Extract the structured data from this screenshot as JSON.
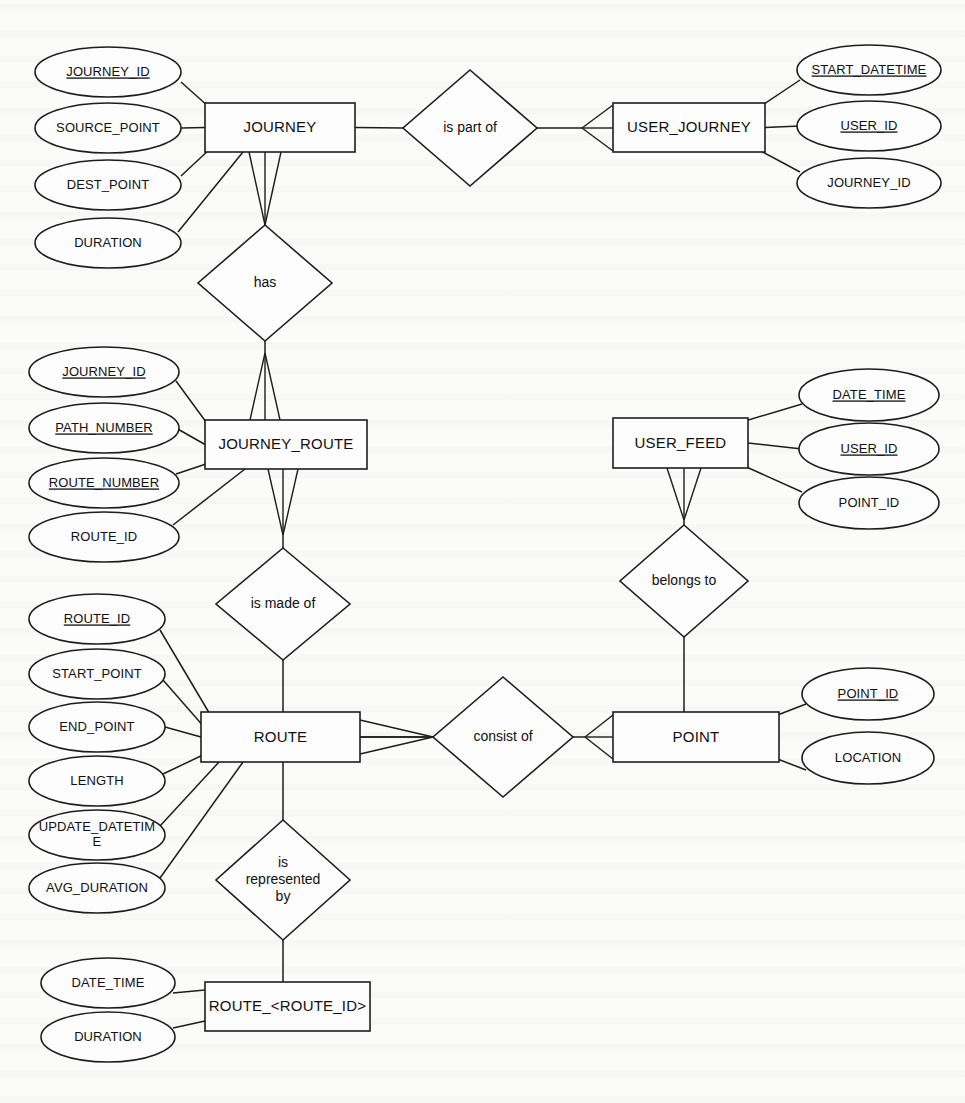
{
  "diagram": {
    "type": "entity-relationship-diagram",
    "notation": "chen-with-crowsfoot",
    "width": 965,
    "height": 1103,
    "background_color": "#fbfbfa",
    "line_color": "#1d1d1d",
    "text_color": "#101010"
  },
  "entities": [
    {
      "id": "journey",
      "label": "JOURNEY",
      "x": 205,
      "y": 103,
      "w": 150,
      "h": 49,
      "attributes": [
        {
          "label": "JOURNEY_ID",
          "pk": true,
          "cx": 108,
          "cy": 72,
          "rx": 73,
          "ry": 25
        },
        {
          "label": "SOURCE_POINT",
          "pk": false,
          "cx": 108,
          "cy": 128,
          "rx": 73,
          "ry": 25
        },
        {
          "label": "DEST_POINT",
          "pk": false,
          "cx": 108,
          "cy": 185,
          "rx": 73,
          "ry": 25
        },
        {
          "label": "DURATION",
          "pk": false,
          "cx": 108,
          "cy": 243,
          "rx": 73,
          "ry": 25
        }
      ]
    },
    {
      "id": "user_journey",
      "label": "USER_JOURNEY",
      "x": 613,
      "y": 103,
      "w": 152,
      "h": 49,
      "attributes": [
        {
          "label": "START_DATETIME",
          "pk": true,
          "cx": 869,
          "cy": 70,
          "rx": 72,
          "ry": 25
        },
        {
          "label": "USER_ID",
          "pk": true,
          "cx": 869,
          "cy": 126,
          "rx": 72,
          "ry": 25
        },
        {
          "label": "JOURNEY_ID",
          "pk": false,
          "cx": 869,
          "cy": 183,
          "rx": 72,
          "ry": 25
        }
      ]
    },
    {
      "id": "journey_route",
      "label": "JOURNEY_ROUTE",
      "x": 205,
      "y": 420,
      "w": 162,
      "h": 49,
      "attributes": [
        {
          "label": "JOURNEY_ID",
          "pk": true,
          "cx": 104,
          "cy": 372,
          "rx": 75,
          "ry": 25
        },
        {
          "label": "PATH_NUMBER",
          "pk": true,
          "cx": 104,
          "cy": 428,
          "rx": 75,
          "ry": 25
        },
        {
          "label": "ROUTE_NUMBER",
          "pk": true,
          "cx": 104,
          "cy": 483,
          "rx": 75,
          "ry": 25
        },
        {
          "label": "ROUTE_ID",
          "pk": false,
          "cx": 104,
          "cy": 537,
          "rx": 75,
          "ry": 25
        }
      ]
    },
    {
      "id": "user_feed",
      "label": "USER_FEED",
      "x": 613,
      "y": 418,
      "w": 135,
      "h": 50,
      "attributes": [
        {
          "label": "DATE_TIME",
          "pk": true,
          "cx": 869,
          "cy": 395,
          "rx": 70,
          "ry": 26
        },
        {
          "label": "USER_ID",
          "pk": true,
          "cx": 869,
          "cy": 449,
          "rx": 70,
          "ry": 26
        },
        {
          "label": "POINT_ID",
          "pk": false,
          "cx": 869,
          "cy": 503,
          "rx": 70,
          "ry": 26
        }
      ]
    },
    {
      "id": "route",
      "label": "ROUTE",
      "x": 201,
      "y": 712,
      "w": 159,
      "h": 50,
      "attributes": [
        {
          "label": "ROUTE_ID",
          "pk": true,
          "cx": 97,
          "cy": 619,
          "rx": 68,
          "ry": 25
        },
        {
          "label": "START_POINT",
          "pk": false,
          "cx": 97,
          "cy": 674,
          "rx": 68,
          "ry": 25
        },
        {
          "label": "END_POINT",
          "pk": false,
          "cx": 97,
          "cy": 727,
          "rx": 68,
          "ry": 25
        },
        {
          "label": "LENGTH",
          "pk": false,
          "cx": 97,
          "cy": 781,
          "rx": 68,
          "ry": 25
        },
        {
          "label": "UPDATE_DATETIME",
          "pk": false,
          "cx": 97,
          "cy": 835,
          "rx": 68,
          "ry": 25,
          "wrapped": [
            "UPDATE_DATETIM",
            "E"
          ]
        },
        {
          "label": "AVG_DURATION",
          "pk": false,
          "cx": 97,
          "cy": 888,
          "rx": 68,
          "ry": 25
        }
      ]
    },
    {
      "id": "point",
      "label": "POINT",
      "x": 613,
      "y": 712,
      "w": 166,
      "h": 50,
      "attributes": [
        {
          "label": "POINT_ID",
          "pk": true,
          "cx": 868,
          "cy": 694,
          "rx": 66,
          "ry": 26
        },
        {
          "label": "LOCATION",
          "pk": false,
          "cx": 868,
          "cy": 758,
          "rx": 66,
          "ry": 26
        }
      ]
    },
    {
      "id": "route_table",
      "label": "ROUTE_<ROUTE_ID>",
      "x": 205,
      "y": 982,
      "w": 165,
      "h": 49,
      "attributes": [
        {
          "label": "DATE_TIME",
          "pk": false,
          "cx": 108,
          "cy": 983,
          "rx": 67,
          "ry": 25
        },
        {
          "label": "DURATION",
          "pk": false,
          "cx": 108,
          "cy": 1037,
          "rx": 67,
          "ry": 25
        }
      ]
    }
  ],
  "relationships": [
    {
      "id": "is-part-of",
      "label": "is part of",
      "cx": 470,
      "cy": 128,
      "rx": 67,
      "ry": 58,
      "lines": [
        "is part of"
      ]
    },
    {
      "id": "has",
      "label": "has",
      "cx": 265,
      "cy": 283,
      "rx": 67,
      "ry": 58,
      "lines": [
        "has"
      ]
    },
    {
      "id": "is-made-of",
      "label": "is made of",
      "cx": 283,
      "cy": 604,
      "rx": 67,
      "ry": 56,
      "lines": [
        "is made of"
      ]
    },
    {
      "id": "belongs-to",
      "label": "belongs to",
      "cx": 684,
      "cy": 581,
      "rx": 64,
      "ry": 56,
      "lines": [
        "belongs to"
      ]
    },
    {
      "id": "consist-of",
      "label": "consist of",
      "cx": 503,
      "cy": 737,
      "rx": 70,
      "ry": 60,
      "lines": [
        "consist of"
      ]
    },
    {
      "id": "is-represented-by",
      "label": "is represented by",
      "cx": 283,
      "cy": 880,
      "rx": 67,
      "ry": 60,
      "lines": [
        "is",
        "represented",
        "by"
      ]
    }
  ]
}
